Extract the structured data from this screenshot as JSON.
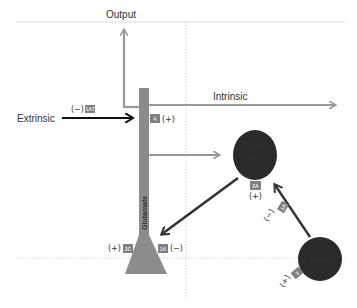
{
  "labels": {
    "output": "Output",
    "extrinsic": "Extrinsic",
    "intrinsic": "Intrinsic",
    "column": "Glutamate"
  },
  "neurons": {
    "pv": {
      "line1": "GABA",
      "line2": "PV+"
    },
    "gaba": {
      "label": "GABA"
    }
  },
  "receptors": {
    "r1a7": {
      "code": "1A7",
      "sign": "(−)"
    },
    "r4": {
      "code": "4",
      "sign": "(+)"
    },
    "r2a": {
      "code": "2A",
      "sign": "(+)"
    },
    "r1a_gaba": {
      "code": "1A",
      "sign": "(−)"
    },
    "r3": {
      "code": "3",
      "sign": "(+)"
    },
    "r2c": {
      "code": "2C",
      "sign": "(+)"
    },
    "r1a_col": {
      "code": "1A",
      "sign": "(−)"
    }
  },
  "colors": {
    "column": "#8c8c8c",
    "grey_arrow": "#999999",
    "black_arrow": "#111111",
    "neuron": "#2a2a2a",
    "badge": "#808080",
    "grid": "#c8c8c8"
  }
}
